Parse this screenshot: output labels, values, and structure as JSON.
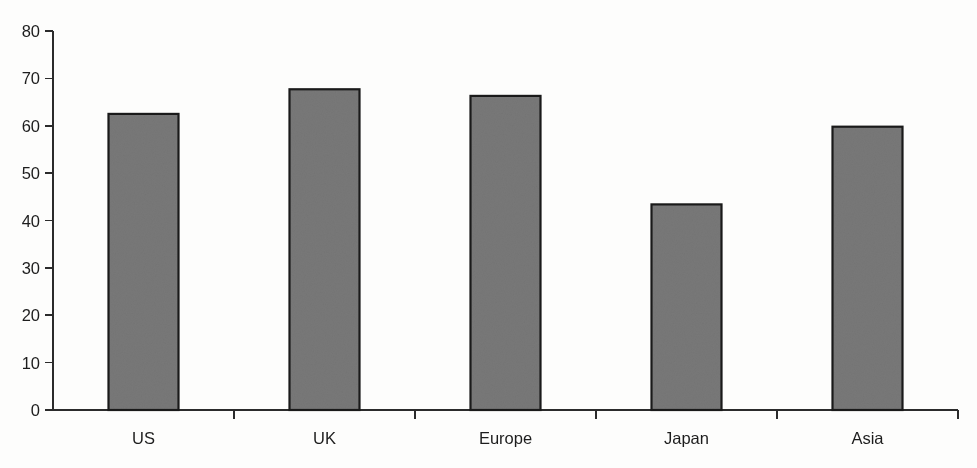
{
  "chart_data": {
    "type": "bar",
    "title": "",
    "subtitle": "",
    "xlabel": "",
    "ylabel": "",
    "categories": [
      "US",
      "UK",
      "Europe",
      "Japan",
      "Asia"
    ],
    "values": [
      62.5,
      67.7,
      66.3,
      43.4,
      59.8
    ],
    "series": [
      {
        "name": "",
        "values": [
          62.5,
          67.7,
          66.3,
          43.4,
          59.8
        ]
      }
    ],
    "ylim": [
      0,
      80
    ],
    "ytick_labels": [
      "0",
      "10",
      "20",
      "30",
      "40",
      "50",
      "60",
      "70",
      "80"
    ],
    "ytick_values": [
      0,
      10,
      20,
      30,
      40,
      50,
      60,
      70,
      80
    ],
    "grid": false,
    "legend": false,
    "legend_position": "none",
    "annotations": [],
    "colors": {
      "bar_fill": "#787878",
      "bar_stroke": "#1a1a1a",
      "axis": "#2b2b2b",
      "text": "#1d1d1d",
      "background": "#fdfdfc"
    }
  }
}
